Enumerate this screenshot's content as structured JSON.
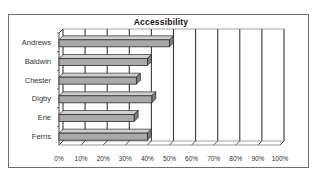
{
  "chart_data": {
    "type": "bar",
    "orientation": "horizontal",
    "style": "3d-clustered-bar",
    "title": "Accessibility",
    "xlabel": "",
    "ylabel": "",
    "categories": [
      "Andrews",
      "Baldwin",
      "Chester",
      "Digby",
      "Erie",
      "Ferris"
    ],
    "values": [
      0.5,
      0.4,
      0.35,
      0.42,
      0.34,
      0.4
    ],
    "xlim": [
      0,
      1
    ],
    "x_ticks": [
      "0%",
      "10%",
      "20%",
      "30%",
      "40%",
      "50%",
      "60%",
      "70%",
      "80%",
      "90%",
      "100%"
    ],
    "grid": true,
    "legend": "none",
    "colors": {
      "bar": "#a9a9a9",
      "bar_outline": "#2b2b2b",
      "grid": "#3a3a3a",
      "border": "#6e6e6e"
    }
  }
}
